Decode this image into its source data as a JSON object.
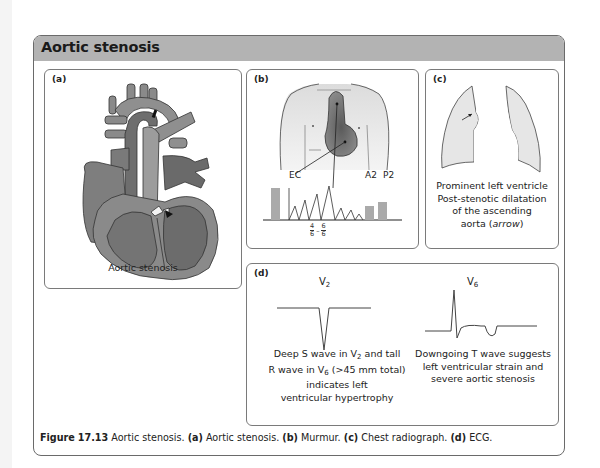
{
  "box": {
    "title": "Aortic stenosis",
    "header_color": "#b3b3b3"
  },
  "panels": {
    "a": {
      "label": "(a)",
      "caption": "Aortic stenosis",
      "illustration": "heart-cross-section-aortic-stenosis"
    },
    "b": {
      "label": "(b)",
      "illustration": "chest-torso-murmur-radiation",
      "labels": {
        "ec": "EC",
        "a2": "A2",
        "p2": "P2",
        "grade_num1": "4",
        "grade_den1": "6",
        "grade_dash": "–",
        "grade_num2": "6",
        "grade_den2": "6"
      }
    },
    "c": {
      "label": "(c)",
      "illustration": "chest-radiograph-outline",
      "caption_lines": [
        "Prominent left ventricle",
        "Post-stenotic dilatation",
        "of the ascending"
      ],
      "caption_last_prefix": "aorta (",
      "caption_last_italic": "arrow",
      "caption_last_suffix": ")"
    },
    "d": {
      "label": "(d)",
      "leads": {
        "v2_main": "V",
        "v2_sub": "2",
        "v6_main": "V",
        "v6_sub": "6"
      },
      "left_text": {
        "l1_a": "Deep S wave in V",
        "l1_sub": "2",
        "l1_b": " and tall",
        "l2_a": "R wave in V",
        "l2_sub": "6",
        "l2_b": " (>45 mm total)",
        "l3": "indicates left",
        "l4": "ventricular hypertrophy"
      },
      "right_text": [
        "Downgoing T wave suggests",
        "left ventricular strain and",
        "severe aortic stenosis"
      ]
    }
  },
  "figure_caption": {
    "figure_label": "Figure",
    "figure_number": "17.13",
    "title": "Aortic stenosis.",
    "parts": [
      {
        "key": "(a)",
        "text": "Aortic stenosis."
      },
      {
        "key": "(b)",
        "text": "Murmur."
      },
      {
        "key": "(c)",
        "text": "Chest radiograph."
      },
      {
        "key": "(d)",
        "text": "ECG."
      }
    ]
  }
}
